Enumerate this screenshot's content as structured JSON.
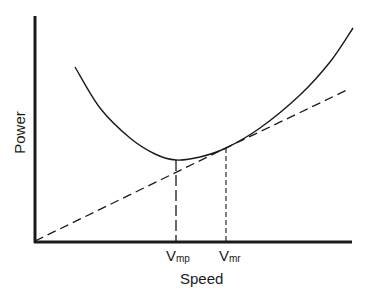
{
  "chart_data": {
    "type": "line",
    "title": "",
    "xlabel": "Speed",
    "ylabel": "Power",
    "grid": false,
    "legend": null,
    "axes": {
      "x_ticks_numeric": false,
      "y_ticks_numeric": false
    },
    "tick_labels": [
      {
        "id": "vmp",
        "main": "V",
        "sub": "mp",
        "meaning": "minimum power speed"
      },
      {
        "id": "vmr",
        "main": "V",
        "sub": "mr",
        "meaning": "maximum range speed"
      }
    ],
    "series": [
      {
        "name": "Power curve",
        "style": "solid",
        "shape": "U-shaped curve; minimum at Vmp",
        "points_px": [
          [
            75,
            67
          ],
          [
            100,
            108
          ],
          [
            130,
            138
          ],
          [
            155,
            154
          ],
          [
            176,
            160
          ],
          [
            200,
            157
          ],
          [
            226,
            148
          ],
          [
            260,
            128
          ],
          [
            300,
            95
          ],
          [
            330,
            62
          ],
          [
            353,
            28
          ]
        ]
      },
      {
        "name": "Tangent from origin",
        "style": "dashed",
        "shape": "straight line from origin, tangent to curve at Vmr",
        "points_px": [
          [
            35,
            241
          ],
          [
            226,
            148
          ],
          [
            347,
            90
          ]
        ]
      },
      {
        "name": "Vmp drop line",
        "style": "dashed",
        "points_px": [
          [
            176,
            160
          ],
          [
            176,
            241
          ]
        ]
      },
      {
        "name": "Vmr drop line",
        "style": "dashed",
        "points_px": [
          [
            226,
            148
          ],
          [
            226,
            241
          ]
        ]
      }
    ],
    "annotations": []
  },
  "colors": {
    "ink": "#1a1a1a",
    "background": "#ffffff"
  }
}
